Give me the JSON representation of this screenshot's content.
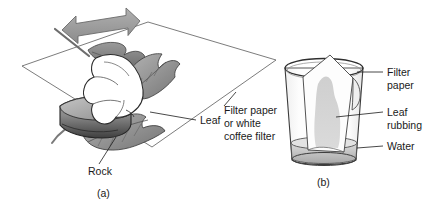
{
  "figure": {
    "background_color": "#ffffff",
    "line_color": "#1a1a1a"
  },
  "panel_a": {
    "caption": "(a)",
    "labels": {
      "leaf": "Leaf",
      "rock": "Rock",
      "filter_line1": "Filter paper",
      "filter_line2": "or white",
      "filter_line3": "coffee filter"
    },
    "objects": {
      "paper": "white-sheet",
      "rock": "rock",
      "hand": "hand",
      "leaf": "leaf",
      "arrow": "double-headed-arrow"
    },
    "colors": {
      "rock_dark": "#4a4a4a",
      "rock_mid": "#8f8f8f",
      "rock_light": "#b8b8b8",
      "leaf_mid": "#a5a5a5",
      "leaf_dark": "#6e6e6e",
      "hand_fill": "#ffffff",
      "arrow_fill": "#9a9a9a",
      "paper_fill": "#ffffff"
    }
  },
  "panel_b": {
    "caption": "(b)",
    "labels": {
      "filter_line1": "Filter",
      "filter_line2": "paper",
      "rubbing_line1": "Leaf",
      "rubbing_line2": "rubbing",
      "water": "Water"
    },
    "objects": {
      "glass": "drinking-glass",
      "filter_paper": "filter-paper-strip",
      "leaf_rubbing": "leaf-rubbing-stain",
      "water": "water-layer"
    },
    "colors": {
      "glass_stroke": "#3c3c3c",
      "glass_fill": "#fbfbfb",
      "paper_fill": "#fdfdfd",
      "rubbing_fill": "#d2d2d2",
      "water_fill": "#c9c9c9"
    }
  }
}
